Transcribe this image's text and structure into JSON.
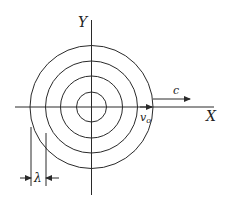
{
  "diagram": {
    "type": "concentric wavefronts",
    "axes": {
      "x_label": "X",
      "y_label": "Y"
    },
    "wavefront_radii_px": [
      15,
      31,
      46,
      61.5
    ],
    "center_px": [
      91.5,
      107
    ],
    "labels": {
      "source_velocity": "v",
      "source_velocity_sub": "o",
      "wave_speed": "c",
      "wavelength": "λ"
    },
    "colors": {
      "ink": "#2a2a2a",
      "background": "#ffffff"
    }
  }
}
